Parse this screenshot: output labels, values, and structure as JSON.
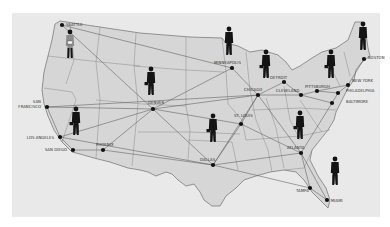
{
  "colors": {
    "page_background": "#ffffff",
    "panel_background": "#e9e9e9",
    "land_fill": "#d6d6d6",
    "border_line": "#6e6e6e",
    "route_line": "#5a5a5a",
    "city_dot": "#111111",
    "figure": "#141414"
  },
  "cities": [
    {
      "name": "SEATTLE",
      "x": 62,
      "y": 25,
      "lx": 66,
      "ly": 26,
      "anchor": "start"
    },
    {
      "name": "SAN FRANCISCO",
      "x": 47,
      "y": 107,
      "lx": 41,
      "ly": 103,
      "anchor": "end",
      "two_line": [
        "SAN",
        "FRANCISCO"
      ]
    },
    {
      "name": "LOS ANGELES",
      "x": 60,
      "y": 137,
      "lx": 54,
      "ly": 139,
      "anchor": "end"
    },
    {
      "name": "SAN DIEGO",
      "x": 73,
      "y": 150,
      "lx": 67,
      "ly": 151,
      "anchor": "end"
    },
    {
      "name": "PHOENIX",
      "x": 103,
      "y": 150,
      "lx": 96,
      "ly": 146,
      "anchor": "start"
    },
    {
      "name": "DENVER",
      "x": 153,
      "y": 109,
      "lx": 148,
      "ly": 104,
      "anchor": "start"
    },
    {
      "name": "MINNEAPOLIS",
      "x": 232,
      "y": 68,
      "lx": 214,
      "ly": 64,
      "anchor": "start"
    },
    {
      "name": "CHICAGO",
      "x": 258,
      "y": 95,
      "lx": 244,
      "ly": 91,
      "anchor": "start"
    },
    {
      "name": "DETROIT",
      "x": 284,
      "y": 82,
      "lx": 270,
      "ly": 79,
      "anchor": "start"
    },
    {
      "name": "CLEVELAND",
      "x": 301,
      "y": 95,
      "lx": 276,
      "ly": 92,
      "anchor": "start"
    },
    {
      "name": "PITTSBURGH",
      "x": 317,
      "y": 91,
      "lx": 305,
      "ly": 88,
      "anchor": "start"
    },
    {
      "name": "NEW YORK",
      "x": 348,
      "y": 85,
      "lx": 352,
      "ly": 82,
      "anchor": "start"
    },
    {
      "name": "PHILADELPHIA",
      "x": 338,
      "y": 93,
      "lx": 346,
      "ly": 92,
      "anchor": "start"
    },
    {
      "name": "BOSTON",
      "x": 364,
      "y": 59,
      "lx": 368,
      "ly": 59,
      "anchor": "start"
    },
    {
      "name": "BALTIMORE",
      "x": 332,
      "y": 103,
      "lx": 346,
      "ly": 103,
      "anchor": "start"
    },
    {
      "name": "ST. LOUIS",
      "x": 241,
      "y": 124,
      "lx": 234,
      "ly": 117,
      "anchor": "start"
    },
    {
      "name": "DALLAS",
      "x": 213,
      "y": 165,
      "lx": 200,
      "ly": 161,
      "anchor": "start"
    },
    {
      "name": "ATLANTA",
      "x": 301,
      "y": 153,
      "lx": 287,
      "ly": 149,
      "anchor": "start"
    },
    {
      "name": "TAMPA",
      "x": 310,
      "y": 188,
      "lx": 296,
      "ly": 192,
      "anchor": "start"
    },
    {
      "name": "MIAMI",
      "x": 327,
      "y": 200,
      "lx": 331,
      "ly": 202,
      "anchor": "start"
    }
  ],
  "figures": [
    {
      "name": "businessman-with-papers",
      "x": 70,
      "y": 48,
      "scale": 1.0,
      "style": "light"
    },
    {
      "name": "businessman-with-briefcase",
      "x": 76,
      "y": 125,
      "scale": 1.0,
      "style": "dark"
    },
    {
      "name": "businessman-with-briefcase",
      "x": 151,
      "y": 85,
      "scale": 1.0,
      "style": "dark"
    },
    {
      "name": "businessman-standing",
      "x": 229,
      "y": 45,
      "scale": 1.0,
      "style": "dark"
    },
    {
      "name": "businessman-with-briefcase",
      "x": 266,
      "y": 68,
      "scale": 1.0,
      "style": "dark"
    },
    {
      "name": "businessman-with-briefcase",
      "x": 331,
      "y": 68,
      "scale": 1.0,
      "style": "dark"
    },
    {
      "name": "businessman-standing",
      "x": 363,
      "y": 40,
      "scale": 1.0,
      "style": "dark"
    },
    {
      "name": "businessman-with-briefcase",
      "x": 213,
      "y": 132,
      "scale": 1.0,
      "style": "dark"
    },
    {
      "name": "businessman-with-briefcase",
      "x": 300,
      "y": 129,
      "scale": 1.0,
      "style": "dark"
    },
    {
      "name": "businessman-standing",
      "x": 335,
      "y": 175,
      "scale": 1.0,
      "style": "dark"
    }
  ],
  "routes": [
    [
      "SEATTLE",
      "DENVER"
    ],
    [
      "SEATTLE",
      "MINNEAPOLIS"
    ],
    [
      "SAN FRANCISCO",
      "DENVER"
    ],
    [
      "SAN FRANCISCO",
      "CHICAGO"
    ],
    [
      "SAN FRANCISCO",
      "LOS ANGELES"
    ],
    [
      "LOS ANGELES",
      "DENVER"
    ],
    [
      "LOS ANGELES",
      "SAN DIEGO"
    ],
    [
      "LOS ANGELES",
      "DALLAS"
    ],
    [
      "SAN DIEGO",
      "PHOENIX"
    ],
    [
      "PHOENIX",
      "DALLAS"
    ],
    [
      "PHOENIX",
      "DENVER"
    ],
    [
      "DENVER",
      "CHICAGO"
    ],
    [
      "DENVER",
      "DALLAS"
    ],
    [
      "DENVER",
      "ST. LOUIS"
    ],
    [
      "DENVER",
      "MINNEAPOLIS"
    ],
    [
      "MINNEAPOLIS",
      "CHICAGO"
    ],
    [
      "CHICAGO",
      "DETROIT"
    ],
    [
      "CHICAGO",
      "CLEVELAND"
    ],
    [
      "CHICAGO",
      "ST. LOUIS"
    ],
    [
      "CHICAGO",
      "ATLANTA"
    ],
    [
      "CHICAGO",
      "DALLAS"
    ],
    [
      "DETROIT",
      "CLEVELAND"
    ],
    [
      "CLEVELAND",
      "PITTSBURGH"
    ],
    [
      "PITTSBURGH",
      "PHILADELPHIA"
    ],
    [
      "PITTSBURGH",
      "NEW YORK"
    ],
    [
      "NEW YORK",
      "BOSTON"
    ],
    [
      "NEW YORK",
      "PHILADELPHIA"
    ],
    [
      "PHILADELPHIA",
      "BALTIMORE"
    ],
    [
      "BALTIMORE",
      "ATLANTA"
    ],
    [
      "CLEVELAND",
      "BALTIMORE"
    ],
    [
      "ST. LOUIS",
      "DALLAS"
    ],
    [
      "ST. LOUIS",
      "ATLANTA"
    ],
    [
      "DALLAS",
      "ATLANTA"
    ],
    [
      "ATLANTA",
      "TAMPA"
    ],
    [
      "ATLANTA",
      "MIAMI"
    ],
    [
      "TAMPA",
      "MIAMI"
    ],
    [
      "DALLAS",
      "TAMPA"
    ]
  ]
}
